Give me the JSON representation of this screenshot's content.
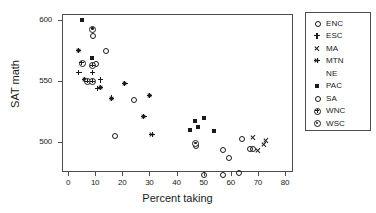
{
  "chart_data": {
    "type": "scatter",
    "title": "",
    "xlabel": "Percent taking",
    "ylabel": "SAT math",
    "xlim": [
      -2,
      84
    ],
    "ylim": [
      468,
      604
    ],
    "xticks": [
      0,
      10,
      20,
      30,
      40,
      50,
      60,
      70,
      80
    ],
    "yticks": [
      500,
      550,
      600
    ],
    "grid": false,
    "legend_position": "right-outside",
    "legend": [
      {
        "name": "ENC",
        "marker": "open-circle"
      },
      {
        "name": "ESC",
        "marker": "plus"
      },
      {
        "name": "MA",
        "marker": "cross"
      },
      {
        "name": "MTN",
        "marker": "asterisk"
      },
      {
        "name": "NE",
        "marker": "none"
      },
      {
        "name": "PAC",
        "marker": "filled-square"
      },
      {
        "name": "SA",
        "marker": "open-circle"
      },
      {
        "name": "WNC",
        "marker": "circled-plus"
      },
      {
        "name": "WSC",
        "marker": "circled-dot"
      }
    ],
    "series": [
      {
        "name": "ENC",
        "marker": "open-circle",
        "points": [
          {
            "x": 9,
            "y": 587
          },
          {
            "x": 14,
            "y": 575
          },
          {
            "x": 10,
            "y": 564
          },
          {
            "x": 17,
            "y": 505
          },
          {
            "x": 24,
            "y": 535
          }
        ]
      },
      {
        "name": "ESC",
        "marker": "plus",
        "points": [
          {
            "x": 4,
            "y": 557
          },
          {
            "x": 9,
            "y": 557
          },
          {
            "x": 12,
            "y": 551
          },
          {
            "x": 11,
            "y": 544
          }
        ]
      },
      {
        "name": "MA",
        "marker": "cross",
        "points": [
          {
            "x": 68,
            "y": 504
          },
          {
            "x": 72,
            "y": 498
          },
          {
            "x": 70,
            "y": 493
          },
          {
            "x": 73,
            "y": 501
          }
        ]
      },
      {
        "name": "MTN",
        "marker": "asterisk",
        "points": [
          {
            "x": 4,
            "y": 575
          },
          {
            "x": 6,
            "y": 551
          },
          {
            "x": 9,
            "y": 550
          },
          {
            "x": 12,
            "y": 545
          },
          {
            "x": 16,
            "y": 536
          },
          {
            "x": 21,
            "y": 548
          },
          {
            "x": 28,
            "y": 521
          },
          {
            "x": 30,
            "y": 538
          },
          {
            "x": 31,
            "y": 506
          }
        ]
      },
      {
        "name": "NE",
        "marker": "none",
        "points": []
      },
      {
        "name": "PAC",
        "marker": "filled-square",
        "points": [
          {
            "x": 5,
            "y": 600
          },
          {
            "x": 9,
            "y": 569
          },
          {
            "x": 45,
            "y": 510
          },
          {
            "x": 47,
            "y": 517
          },
          {
            "x": 48,
            "y": 512
          },
          {
            "x": 50,
            "y": 520
          },
          {
            "x": 54,
            "y": 509
          }
        ]
      },
      {
        "name": "SA",
        "marker": "open-circle",
        "points": [
          {
            "x": 47,
            "y": 497
          },
          {
            "x": 50,
            "y": 473
          },
          {
            "x": 57,
            "y": 494
          },
          {
            "x": 57,
            "y": 473
          },
          {
            "x": 59,
            "y": 487
          },
          {
            "x": 63,
            "y": 475
          },
          {
            "x": 64,
            "y": 503
          },
          {
            "x": 67,
            "y": 495
          },
          {
            "x": 68,
            "y": 495
          }
        ]
      },
      {
        "name": "WNC",
        "marker": "circled-plus",
        "points": [
          {
            "x": 5,
            "y": 565
          },
          {
            "x": 7,
            "y": 550
          },
          {
            "x": 9,
            "y": 550
          },
          {
            "x": 9,
            "y": 563
          }
        ]
      },
      {
        "name": "WSC",
        "marker": "circled-dot",
        "points": [
          {
            "x": 9,
            "y": 593
          },
          {
            "x": 47,
            "y": 499
          }
        ]
      }
    ]
  },
  "axes": {
    "xlabel": "Percent taking",
    "ylabel": "SAT math",
    "xtick_labels": [
      "0",
      "10",
      "20",
      "30",
      "40",
      "50",
      "60",
      "70",
      "80"
    ],
    "ytick_labels": [
      "500",
      "550",
      "600"
    ]
  },
  "colors": {
    "marker": "#1a1a1a",
    "frame": "#4d4d4d",
    "background": "#ffffff"
  }
}
